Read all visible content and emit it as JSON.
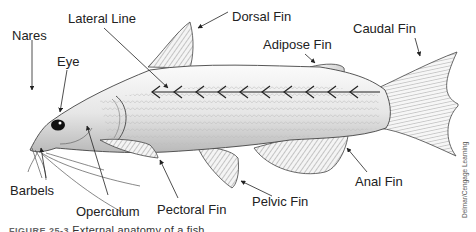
{
  "diagram": {
    "title": "External anatomy of a fish",
    "labels": {
      "nares": "Nares",
      "eye": "Eye",
      "lateral_line": "Lateral Line",
      "dorsal_fin": "Dorsal Fin",
      "adipose_fin": "Adipose Fin",
      "caudal_fin": "Caudal Fin",
      "barbels": "Barbels",
      "operculum": "Operculum",
      "pectoral_fin": "Pectoral Fin",
      "pelvic_fin": "Pelvic Fin",
      "anal_fin": "Anal Fin"
    },
    "credit": "Delmar/Cengage Learning",
    "caption": {
      "figure_number": "FIGURE 25-3",
      "text": "External anatomy of a fish"
    },
    "colors": {
      "body_light": "#f2f2f2",
      "body_dark": "#b8b8b8",
      "outline": "#444444",
      "fin_stripe": "#555555",
      "arrow": "#222222"
    }
  }
}
